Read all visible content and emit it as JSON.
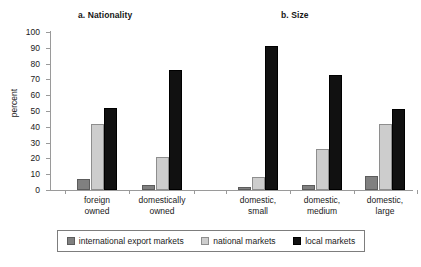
{
  "chart_data": {
    "type": "bar",
    "title": "",
    "xlabel": "",
    "ylabel": "percent",
    "ylim": [
      0,
      100
    ],
    "yticks": [
      0,
      10,
      20,
      30,
      40,
      50,
      60,
      70,
      80,
      90,
      100
    ],
    "grid": false,
    "legend_position": "bottom",
    "panels": [
      {
        "title": "a. Nationality",
        "categories": [
          "foreign\nowned",
          "domestically\nowned"
        ],
        "series": [
          {
            "name": "international export markets",
            "color": "#808080",
            "values": [
              7,
              3
            ]
          },
          {
            "name": "national markets",
            "color": "#cdcdcd",
            "values": [
              42,
              21
            ]
          },
          {
            "name": "local markets",
            "color": "#111111",
            "values": [
              52,
              76
            ]
          }
        ]
      },
      {
        "title": "b. Size",
        "categories": [
          "domestic,\nsmall",
          "domestic,\nmedium",
          "domestic,\nlarge"
        ],
        "series": [
          {
            "name": "international export markets",
            "color": "#808080",
            "values": [
              2,
              3,
              9
            ]
          },
          {
            "name": "national markets",
            "color": "#cdcdcd",
            "values": [
              8,
              26,
              42
            ]
          },
          {
            "name": "local markets",
            "color": "#111111",
            "values": [
              91,
              73,
              51
            ]
          }
        ]
      }
    ],
    "legend": [
      {
        "label": "international export markets",
        "color": "#808080"
      },
      {
        "label": "national markets",
        "color": "#cdcdcd"
      },
      {
        "label": "local markets",
        "color": "#111111"
      }
    ]
  }
}
